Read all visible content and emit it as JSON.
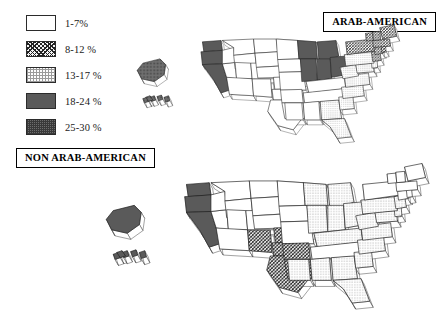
{
  "figure": {
    "caption_top": "ARAB-AMERICAN",
    "caption_bottom": "NON ARAB-AMERICAN"
  },
  "legend": {
    "title": "",
    "items": [
      {
        "label": "1-7%",
        "pattern": "white",
        "range_low": 1,
        "range_high": 7,
        "color": "#ffffff"
      },
      {
        "label": "8-12 %",
        "pattern": "cross-hatch",
        "range_low": 8,
        "range_high": 12,
        "color": "#222222"
      },
      {
        "label": "13-17 %",
        "pattern": "stipple",
        "range_low": 13,
        "range_high": 17,
        "color": "#9a9a9a"
      },
      {
        "label": "18-24 %",
        "pattern": "solid-dark",
        "range_low": 18,
        "range_high": 24,
        "color": "#5a5a5a"
      },
      {
        "label": "25-30 %",
        "pattern": "dotted-dark",
        "range_low": 25,
        "range_high": 30,
        "color": "#6e6e6e"
      }
    ]
  },
  "chart_data": {
    "type": "map",
    "subtype": "choropleth-3d-extruded",
    "legend_position": "top-left",
    "classes": [
      "1-7%",
      "8-12 %",
      "13-17 %",
      "18-24 %",
      "25-30 %"
    ],
    "maps": [
      {
        "name": "ARAB-AMERICAN",
        "position": "top",
        "states": [
          {
            "code": "WA",
            "class": 4
          },
          {
            "code": "OR",
            "class": 4
          },
          {
            "code": "CA",
            "class": 4
          },
          {
            "code": "NV",
            "class": 1
          },
          {
            "code": "ID",
            "class": 1
          },
          {
            "code": "MT",
            "class": 1
          },
          {
            "code": "WY",
            "class": 1
          },
          {
            "code": "UT",
            "class": 1
          },
          {
            "code": "AZ",
            "class": 1
          },
          {
            "code": "NM",
            "class": 1
          },
          {
            "code": "CO",
            "class": 1
          },
          {
            "code": "ND",
            "class": 1
          },
          {
            "code": "SD",
            "class": 1
          },
          {
            "code": "NE",
            "class": 1
          },
          {
            "code": "KS",
            "class": 1
          },
          {
            "code": "OK",
            "class": 1
          },
          {
            "code": "TX",
            "class": 1
          },
          {
            "code": "MN",
            "class": 1
          },
          {
            "code": "IA",
            "class": 1
          },
          {
            "code": "MO",
            "class": 1
          },
          {
            "code": "AR",
            "class": 1
          },
          {
            "code": "LA",
            "class": 1
          },
          {
            "code": "WI",
            "class": 4
          },
          {
            "code": "MI",
            "class": 4
          },
          {
            "code": "IL",
            "class": 4
          },
          {
            "code": "IN",
            "class": 4
          },
          {
            "code": "OH",
            "class": 4
          },
          {
            "code": "KY",
            "class": 1
          },
          {
            "code": "TN",
            "class": 1
          },
          {
            "code": "MS",
            "class": 1
          },
          {
            "code": "AL",
            "class": 1
          },
          {
            "code": "GA",
            "class": 3
          },
          {
            "code": "FL",
            "class": 3
          },
          {
            "code": "SC",
            "class": 3
          },
          {
            "code": "NC",
            "class": 3
          },
          {
            "code": "VA",
            "class": 3
          },
          {
            "code": "WV",
            "class": 3
          },
          {
            "code": "MD",
            "class": 3
          },
          {
            "code": "DE",
            "class": 3
          },
          {
            "code": "PA",
            "class": 3
          },
          {
            "code": "NJ",
            "class": 2
          },
          {
            "code": "NY",
            "class": 2
          },
          {
            "code": "CT",
            "class": 2
          },
          {
            "code": "RI",
            "class": 2
          },
          {
            "code": "MA",
            "class": 2
          },
          {
            "code": "VT",
            "class": 2
          },
          {
            "code": "NH",
            "class": 2
          },
          {
            "code": "ME",
            "class": 2
          },
          {
            "code": "AK",
            "class": 5
          },
          {
            "code": "HI",
            "class": 5
          }
        ]
      },
      {
        "name": "NON ARAB-AMERICAN",
        "position": "bottom",
        "states": [
          {
            "code": "WA",
            "class": 4
          },
          {
            "code": "OR",
            "class": 4
          },
          {
            "code": "CA",
            "class": 4
          },
          {
            "code": "NV",
            "class": 1
          },
          {
            "code": "ID",
            "class": 1
          },
          {
            "code": "MT",
            "class": 1
          },
          {
            "code": "WY",
            "class": 1
          },
          {
            "code": "UT",
            "class": 1
          },
          {
            "code": "AZ",
            "class": 1
          },
          {
            "code": "NM",
            "class": 2
          },
          {
            "code": "CO",
            "class": 1
          },
          {
            "code": "ND",
            "class": 1
          },
          {
            "code": "SD",
            "class": 1
          },
          {
            "code": "NE",
            "class": 1
          },
          {
            "code": "KS",
            "class": 2
          },
          {
            "code": "OK",
            "class": 2
          },
          {
            "code": "TX",
            "class": 2
          },
          {
            "code": "MN",
            "class": 1
          },
          {
            "code": "IA",
            "class": 1
          },
          {
            "code": "MO",
            "class": 1
          },
          {
            "code": "AR",
            "class": 2
          },
          {
            "code": "LA",
            "class": 2
          },
          {
            "code": "WI",
            "class": 3
          },
          {
            "code": "MI",
            "class": 3
          },
          {
            "code": "IL",
            "class": 3
          },
          {
            "code": "IN",
            "class": 3
          },
          {
            "code": "OH",
            "class": 3
          },
          {
            "code": "KY",
            "class": 3
          },
          {
            "code": "TN",
            "class": 1
          },
          {
            "code": "MS",
            "class": 3
          },
          {
            "code": "AL",
            "class": 3
          },
          {
            "code": "GA",
            "class": 3
          },
          {
            "code": "FL",
            "class": 3
          },
          {
            "code": "SC",
            "class": 3
          },
          {
            "code": "NC",
            "class": 3
          },
          {
            "code": "VA",
            "class": 3
          },
          {
            "code": "WV",
            "class": 3
          },
          {
            "code": "MD",
            "class": 3
          },
          {
            "code": "DE",
            "class": 3
          },
          {
            "code": "PA",
            "class": 3
          },
          {
            "code": "NJ",
            "class": 3
          },
          {
            "code": "NY",
            "class": 1
          },
          {
            "code": "CT",
            "class": 1
          },
          {
            "code": "RI",
            "class": 1
          },
          {
            "code": "MA",
            "class": 1
          },
          {
            "code": "VT",
            "class": 1
          },
          {
            "code": "NH",
            "class": 1
          },
          {
            "code": "ME",
            "class": 1
          },
          {
            "code": "AK",
            "class": 4
          },
          {
            "code": "HI",
            "class": 4
          }
        ]
      }
    ]
  }
}
